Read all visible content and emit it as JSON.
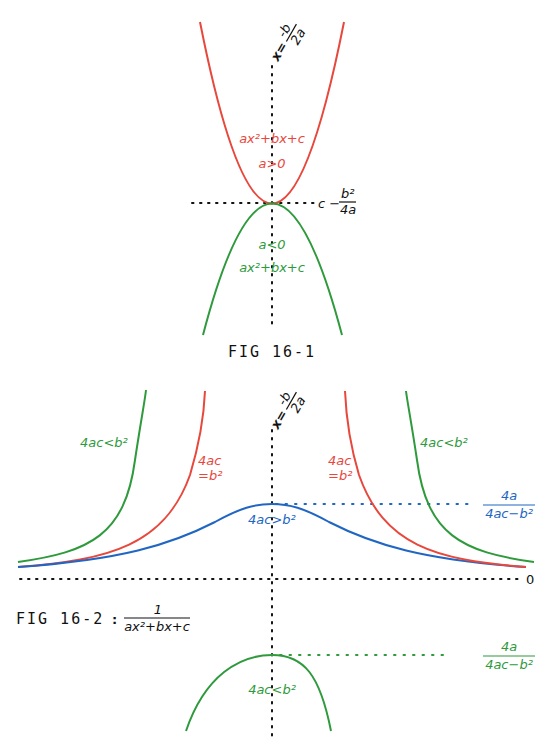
{
  "colors": {
    "red": "#e8473c",
    "green": "#2e9a3c",
    "blue": "#2166c2",
    "axis": "#111111"
  },
  "fig1": {
    "caption": "FIG 16-1",
    "axis_label": {
      "lhs": "x=",
      "num": "-b",
      "den": "2a"
    },
    "upward": {
      "expr": "ax²+bx+c",
      "cond": "a>0"
    },
    "downward": {
      "cond": "a<0",
      "expr": "ax²+bx+c"
    },
    "vertex_label": {
      "prefix": "c −",
      "num": "b²",
      "den": "4a"
    }
  },
  "fig2": {
    "caption": "FIG 16-2",
    "separator": ":",
    "function": {
      "num": "1",
      "den": "ax²+bx+c"
    },
    "axis_label": {
      "lhs": "x=",
      "num": "-b",
      "den": "2a"
    },
    "left_green": "4ac<b²",
    "right_green": "4ac<b²",
    "left_red": {
      "line1": "4ac",
      "line2": "=b²"
    },
    "right_red": {
      "line1": "4ac",
      "line2": "=b²"
    },
    "blue": "4ac>b²",
    "blue_peak_label": {
      "num": "4a",
      "den": "4ac−b²"
    },
    "zero_label": "0",
    "lower_cap": "4ac<b²",
    "lower_peak_label": {
      "num": "4a",
      "den": "4ac−b²"
    }
  }
}
